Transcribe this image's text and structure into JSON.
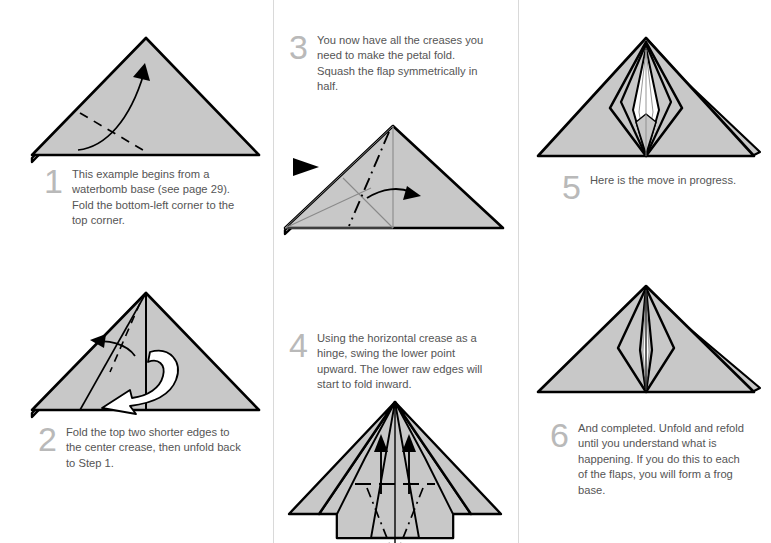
{
  "document": {
    "type": "origami-instruction-diagram",
    "title": "Petal fold from a waterbomb base",
    "page_background": "#ffffff",
    "columns": 3,
    "divider_color": "#d9d9d9"
  },
  "style": {
    "paper_fill": "#c8c8c8",
    "paper_fill_light": "#d2d2d2",
    "paper_white": "#ffffff",
    "outline_color": "#000000",
    "crease_color": "#8a8a8a",
    "number_color": "#b9b9b9",
    "text_color": "#555555"
  },
  "steps": [
    {
      "number": "1",
      "text": "This example begins from a waterbomb base (see page 29). Fold the bottom-left corner to the top corner.",
      "column": 1,
      "figure": "triangle-with-valley-fold-and-arrow"
    },
    {
      "number": "2",
      "text": "Fold the top two shorter edges to the center crease, then unfold back to Step 1.",
      "column": 1,
      "figure": "triangle-with-center-crease-and-unfold-arrow"
    },
    {
      "number": "3",
      "text": "You now have all the creases you need to make the petal fold. Squash the flap symmetrically in half.",
      "column": 2,
      "figure": "triangle-with-mountain-fold-and-squash-arrow"
    },
    {
      "number": "4",
      "text": "Using the horizontal crease as a hinge, swing the lower point upward. The lower raw edges will start to fold inward.",
      "column": 2,
      "figure": "swept-wing-with-upward-arrows"
    },
    {
      "number": "5",
      "text": "Here is the move in progress.",
      "column": 3,
      "figure": "petal-fold-in-progress"
    },
    {
      "number": "6",
      "text": "And completed. Unfold and refold until you understand what is happening. If you do this to each of the flaps, you will form a frog base.",
      "column": 3,
      "figure": "petal-fold-completed"
    }
  ],
  "symbols": {
    "valley_fold": "dashed-line",
    "mountain_fold": "dash-dot-line",
    "existing_crease": "thin-gray-line",
    "fold_arrow": "solid-black-arrow",
    "unfold_arrow": "white-outlined-arrow",
    "view_marker": "black-triangle"
  }
}
